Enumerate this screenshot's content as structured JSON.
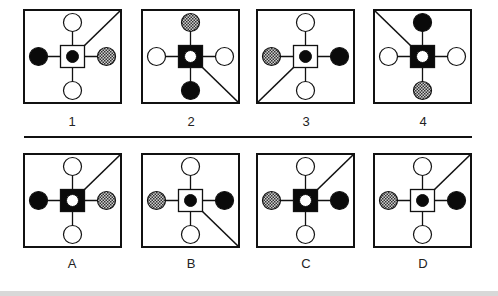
{
  "question": {
    "panels": [
      {
        "label": "1",
        "center": "white-square-black-dot",
        "top": "white",
        "bottom": "white",
        "left": "black",
        "right": "checkered",
        "diagonal": "top-right"
      },
      {
        "label": "2",
        "center": "black-square-white-dot",
        "top": "checkered",
        "bottom": "black",
        "left": "white",
        "right": "white",
        "diagonal": "bottom-right"
      },
      {
        "label": "3",
        "center": "white-square-black-dot",
        "top": "white",
        "bottom": "white",
        "left": "checkered",
        "right": "black",
        "diagonal": "bottom-left"
      },
      {
        "label": "4",
        "center": "black-square-white-dot",
        "top": "black",
        "bottom": "checkered",
        "left": "white",
        "right": "white",
        "diagonal": "top-left"
      }
    ]
  },
  "options": {
    "panels": [
      {
        "label": "A",
        "center": "black-square-white-dot",
        "top": "white",
        "bottom": "white",
        "left": "black",
        "right": "checkered",
        "diagonal": "top-right"
      },
      {
        "label": "B",
        "center": "white-square-black-dot",
        "top": "white",
        "bottom": "white",
        "left": "checkered",
        "right": "black",
        "diagonal": "bottom-right"
      },
      {
        "label": "C",
        "center": "black-square-white-dot",
        "top": "white",
        "bottom": "white",
        "left": "checkered",
        "right": "black",
        "diagonal": "top-right"
      },
      {
        "label": "D",
        "center": "white-square-black-dot",
        "top": "white",
        "bottom": "white",
        "left": "checkered",
        "right": "black",
        "diagonal": "top-right"
      }
    ]
  },
  "colors": {
    "stroke": "#111111",
    "fill_black": "#0a0a0a",
    "fill_white": "#ffffff",
    "checker_dark": "#333333",
    "checker_light": "#cfcfcf"
  }
}
